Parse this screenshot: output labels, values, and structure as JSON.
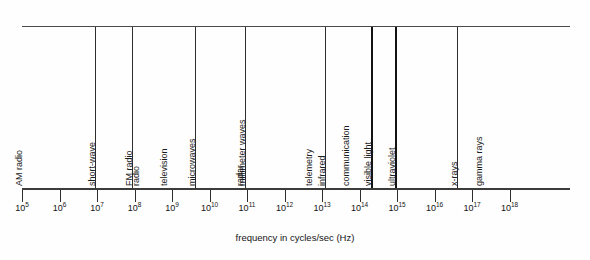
{
  "figure": {
    "caption": "frequency in cycles/sec (Hz)",
    "axis_label": "frequency in cycles/sec (Hz)",
    "line_color": "#2e2e2e",
    "background": "#fefefe"
  },
  "chart_data": {
    "type": "bar",
    "title": "",
    "subtitle": "",
    "xlabel": "frequency in cycles/sec (Hz)",
    "ylabel": "",
    "grid": false,
    "legend_position": "none",
    "scale": "log10",
    "axis_range_exponent": [
      5,
      18
    ],
    "tick_labels": [
      "10⁵",
      "10⁶",
      "10⁷",
      "10⁸",
      "10⁹",
      "10¹⁰",
      "10¹¹",
      "10¹²",
      "10¹³",
      "10¹⁴",
      "10¹⁵",
      "10¹⁶",
      "10¹⁷",
      "10¹⁸"
    ],
    "tick_bases": [
      10,
      10,
      10,
      10,
      10,
      10,
      10,
      10,
      10,
      10,
      10,
      10,
      10,
      10
    ],
    "tick_exponents": [
      5,
      6,
      7,
      8,
      9,
      10,
      11,
      12,
      13,
      14,
      15,
      16,
      17,
      18
    ],
    "categories": [
      "AM radio",
      "short-wave radio",
      "FM radio television",
      "microwaves radar",
      "millimeter waves telemetry communication",
      "infrared",
      "visible light",
      "ultraviolet",
      "x-rays gamma rays"
    ],
    "bands": [
      {
        "name": "AM radio",
        "lines": [
          "AM radio"
        ],
        "start_exponent": 5.0,
        "end_exponent": 6.95,
        "emphasis": false
      },
      {
        "name": "short-wave radio",
        "lines": [
          "short-wave",
          "radio"
        ],
        "start_exponent": 6.95,
        "end_exponent": 7.93,
        "emphasis": false
      },
      {
        "name": "FM radio television",
        "lines": [
          "FM radio",
          "television"
        ],
        "start_exponent": 7.93,
        "end_exponent": 9.62,
        "emphasis": false
      },
      {
        "name": "microwaves radar",
        "lines": [
          "microwaves",
          "radar"
        ],
        "start_exponent": 9.62,
        "end_exponent": 10.95,
        "emphasis": false
      },
      {
        "name": "millimeter waves telemetry communication",
        "lines": [
          "millimeter waves",
          "telemetry",
          "communication"
        ],
        "start_exponent": 10.95,
        "end_exponent": 13.08,
        "emphasis": false
      },
      {
        "name": "infrared",
        "lines": [
          "infrared"
        ],
        "start_exponent": 13.08,
        "end_exponent": 14.3,
        "emphasis": false
      },
      {
        "name": "visible light",
        "lines": [
          "visible light"
        ],
        "start_exponent": 14.3,
        "end_exponent": 14.95,
        "emphasis": true
      },
      {
        "name": "ultraviolet",
        "lines": [
          "ultraviolet"
        ],
        "start_exponent": 14.95,
        "end_exponent": 16.6,
        "emphasis": false
      },
      {
        "name": "x-rays gamma rays",
        "lines": [
          "x-rays",
          "gamma rays"
        ],
        "start_exponent": 16.6,
        "end_exponent": 18.5,
        "emphasis": false
      }
    ]
  }
}
